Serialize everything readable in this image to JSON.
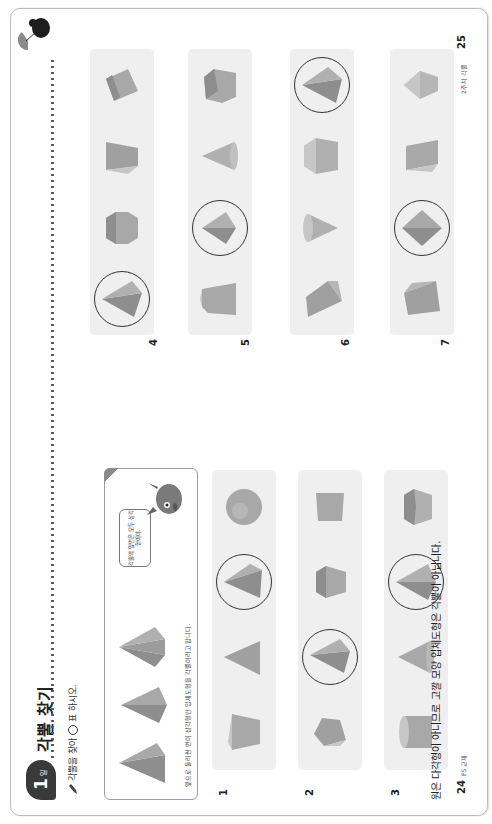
{
  "header": {
    "day_number": "1",
    "day_unit": "일",
    "title": "각뿔 찾기"
  },
  "instruction": {
    "pre": "각뿔을 찾아",
    "post": "표 하시오."
  },
  "example": {
    "caption": "옆으로 둘러싼 면이 삼각형인 입체도형을 각뿔이라고 합니다.",
    "bubble_text": "각뿔의 옆면은 모두 삼각형이야."
  },
  "left_rows": [
    {
      "label": "1",
      "shapes": [
        "truncated-pyramid",
        "triangular-pyramid",
        "pyramid",
        "sphere"
      ],
      "circled": [
        2
      ]
    },
    {
      "label": "2",
      "shapes": [
        "pentagonal-prism",
        "pyramid",
        "hexagonal-prism",
        "truncated-pyramid"
      ],
      "circled": [
        1
      ]
    },
    {
      "label": "3",
      "shapes": [
        "cylinder",
        "cone",
        "pyramid",
        "pentagonal-prism"
      ],
      "circled": [
        2
      ]
    }
  ],
  "right_rows": [
    {
      "label": "4",
      "shapes": [
        "pyramid",
        "hexagonal-prism",
        "truncated-pyramid",
        "rectangular-prism"
      ],
      "circled": [
        0
      ]
    },
    {
      "label": "5",
      "shapes": [
        "pentagonal-truncated-pyramid",
        "square-pyramid",
        "cone",
        "pentagonal-prism"
      ],
      "circled": [
        1
      ]
    },
    {
      "label": "6",
      "shapes": [
        "triangular-prism",
        "cone",
        "hexagonal-prism",
        "pyramid"
      ],
      "circled": [
        3
      ]
    },
    {
      "label": "7",
      "shapes": [
        "triangular-prism",
        "square-pyramid",
        "rectangular-prism",
        "hexagonal-pyramid"
      ],
      "circled": [
        1
      ]
    }
  ],
  "note": "원은 다각형이 아니므로 고깔 모양 입체도형은 각뿔이 아닙니다.",
  "footer": {
    "left_page_number": "24",
    "left_meta": "FS 교재",
    "right_page_number": "25",
    "right_meta": "2주차 각뿔"
  },
  "colors": {
    "row_bg": "#efefef",
    "shape_dark": "#8e8e8e",
    "shape_mid": "#a8a8a8",
    "shape_light": "#c6c6c6",
    "badge": "#3a3a3a"
  }
}
